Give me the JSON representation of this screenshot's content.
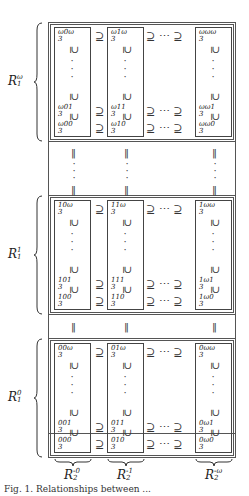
{
  "figure": {
    "base": "R",
    "row_groups": [
      {
        "label": {
          "base": "R",
          "sub": "1",
          "sup": "ω"
        },
        "cells": [
          [
            {
              "sup": "ω0ω",
              "sub": "3"
            },
            {
              "sup": "ω1ω",
              "sub": "3"
            },
            {
              "sup": "ωωω",
              "sub": "3"
            }
          ],
          [
            {
              "sup": "ω01",
              "sub": "3"
            },
            {
              "sup": "ω11",
              "sub": "3"
            },
            {
              "sup": "ωω1",
              "sub": "3"
            }
          ],
          [
            {
              "sup": "ω00",
              "sub": "3"
            },
            {
              "sup": "ω10",
              "sub": "3"
            },
            {
              "sup": "ωω0",
              "sub": "3"
            }
          ]
        ]
      },
      {
        "label": {
          "base": "R",
          "sub": "1",
          "sup": "1"
        },
        "cells": [
          [
            {
              "sup": "10ω",
              "sub": "3"
            },
            {
              "sup": "11ω",
              "sub": "3"
            },
            {
              "sup": "1ωω",
              "sub": "3"
            }
          ],
          [
            {
              "sup": "101",
              "sub": "3"
            },
            {
              "sup": "111",
              "sub": "3"
            },
            {
              "sup": "1ω1",
              "sub": "3"
            }
          ],
          [
            {
              "sup": "100",
              "sub": "3"
            },
            {
              "sup": "110",
              "sub": "3"
            },
            {
              "sup": "1ω0",
              "sub": "3"
            }
          ]
        ]
      },
      {
        "label": {
          "base": "R",
          "sub": "1",
          "sup": "0"
        },
        "cells": [
          [
            {
              "sup": "00ω",
              "sub": "3"
            },
            {
              "sup": "01ω",
              "sub": "3"
            },
            {
              "sup": "0ωω",
              "sub": "3"
            }
          ],
          [
            {
              "sup": "001",
              "sub": "3"
            },
            {
              "sup": "011",
              "sub": "3"
            },
            {
              "sup": "0ω1",
              "sub": "3"
            }
          ],
          [
            {
              "sup": "000",
              "sub": "3"
            },
            {
              "sup": "010",
              "sub": "3"
            },
            {
              "sup": "0ω0",
              "sub": "3"
            }
          ]
        ]
      }
    ],
    "column_labels": [
      {
        "base": "R",
        "sub": "2",
        "sup": "-0"
      },
      {
        "base": "R",
        "sub": "2",
        "sup": "-1"
      },
      {
        "base": "R",
        "sub": "2",
        "sup": "-ω"
      }
    ],
    "symbols": {
      "superset": "⊇",
      "subset_vertical": "⊆",
      "hdots": "⋯",
      "equals_vertical": "‖",
      "vdots": "⋮"
    },
    "caption": "Fig. 1. Relationships between ..."
  }
}
